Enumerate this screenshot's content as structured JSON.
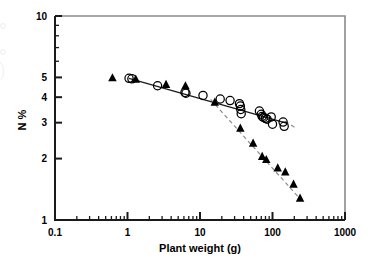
{
  "figure": {
    "axis_color": "#1a1a1a",
    "marker_color": "#000000",
    "fit_line_color": "#1a1a1a",
    "dashed_line_color": "#8c8c8c"
  },
  "chart_data": {
    "type": "scatter",
    "title": "",
    "xlabel": "Plant weight (g)",
    "ylabel": "N %",
    "xscale": "log",
    "yscale": "log",
    "xlim": [
      0.1,
      1000
    ],
    "ylim": [
      1,
      10
    ],
    "xticks": [
      0.1,
      1,
      10,
      100,
      1000
    ],
    "xtick_labels": [
      "0.1",
      "1",
      "10",
      "100",
      "1000"
    ],
    "yticks": [
      1,
      2,
      3,
      4,
      5,
      10
    ],
    "ytick_labels": [
      "1",
      "2",
      "3",
      "4",
      "5",
      "10"
    ],
    "grid": false,
    "legend": "none",
    "series": [
      {
        "name": "open-circles",
        "marker": "open-circle",
        "points": [
          [
            1.05,
            4.95
          ],
          [
            1.15,
            4.92
          ],
          [
            2.6,
            4.55
          ],
          [
            6.2,
            4.22
          ],
          [
            6.4,
            4.18
          ],
          [
            11.0,
            4.08
          ],
          [
            19.0,
            3.92
          ],
          [
            26.0,
            3.85
          ],
          [
            35.0,
            3.72
          ],
          [
            36.0,
            3.62
          ],
          [
            36.5,
            3.48
          ],
          [
            37.0,
            3.32
          ],
          [
            66.0,
            3.42
          ],
          [
            70.0,
            3.3
          ],
          [
            72.0,
            3.22
          ],
          [
            75.0,
            3.18
          ],
          [
            80.0,
            3.15
          ],
          [
            84.0,
            3.12
          ],
          [
            96.0,
            3.2
          ],
          [
            100.0,
            2.95
          ],
          [
            140.0,
            3.02
          ],
          [
            145.0,
            2.88
          ]
        ]
      },
      {
        "name": "filled-triangles",
        "marker": "filled-triangle",
        "points": [
          [
            0.62,
            4.98
          ],
          [
            1.3,
            4.9
          ],
          [
            3.4,
            4.62
          ],
          [
            6.3,
            4.55
          ],
          [
            16.0,
            3.78
          ],
          [
            36.0,
            2.82
          ],
          [
            54.0,
            2.38
          ],
          [
            72.0,
            2.05
          ],
          [
            82.0,
            1.98
          ],
          [
            118.0,
            1.8
          ],
          [
            150.0,
            1.72
          ],
          [
            195.0,
            1.5
          ],
          [
            240.0,
            1.28
          ]
        ]
      }
    ],
    "fit_lines": [
      {
        "name": "circle-fit-solid",
        "style": "solid",
        "from": [
          1.05,
          4.95
        ],
        "to": [
          160.0,
          2.98
        ]
      },
      {
        "name": "triangle-fit-dashed",
        "style": "dashed",
        "from": [
          14.0,
          3.9
        ],
        "to": [
          250.0,
          1.25
        ]
      },
      {
        "name": "circle-fit-dashed-tail",
        "style": "dashed",
        "from": [
          150.0,
          3.05
        ],
        "to": [
          215.0,
          2.8
        ]
      }
    ]
  }
}
